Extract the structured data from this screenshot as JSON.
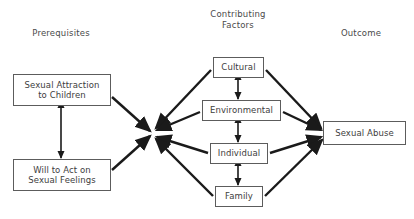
{
  "diagram": {
    "type": "flow-diagram",
    "background_color": "#ffffff",
    "line_color": "#1a1a1a",
    "box_border_color": "#5c5c5c",
    "text_color": "#3d3d3d",
    "columns": [
      {
        "id": "prerequisites",
        "label": "Prerequisites",
        "x": 61,
        "y": 33
      },
      {
        "id": "contributing-factors",
        "label": "Contributing\nFactors",
        "x": 238,
        "y": 14
      },
      {
        "id": "outcome",
        "label": "Outcome",
        "x": 361,
        "y": 33
      }
    ],
    "nodes": [
      {
        "id": "sexual-attraction",
        "label": "Sexual Attraction\nto Children",
        "x": 13,
        "y": 74,
        "w": 98,
        "h": 32
      },
      {
        "id": "will-to-act",
        "label": "Will to Act on\nSexual Feelings",
        "x": 13,
        "y": 159,
        "w": 98,
        "h": 32
      },
      {
        "id": "cultural",
        "label": "Cultural",
        "x": 213,
        "y": 57,
        "w": 51,
        "h": 21
      },
      {
        "id": "environmental",
        "label": "Environmental",
        "x": 202,
        "y": 100,
        "w": 79,
        "h": 21
      },
      {
        "id": "individual",
        "label": "Individual",
        "x": 210,
        "y": 143,
        "w": 58,
        "h": 21
      },
      {
        "id": "family",
        "label": "Family",
        "x": 215,
        "y": 186,
        "w": 48,
        "h": 21
      },
      {
        "id": "sexual-abuse",
        "label": "Sexual Abuse",
        "x": 323,
        "y": 121,
        "w": 83,
        "h": 24
      }
    ],
    "junction": {
      "id": "prerequisite-junction",
      "x": 152,
      "y": 133
    },
    "edges": [
      {
        "id": "attraction-to-junction",
        "from": "sexual-attraction",
        "to": "prerequisite-junction",
        "arrow": "single"
      },
      {
        "id": "will-to-junction",
        "from": "will-to-act",
        "to": "prerequisite-junction",
        "arrow": "single"
      },
      {
        "id": "attraction-will-bidirectional",
        "from": "sexual-attraction",
        "to": "will-to-act",
        "arrow": "double"
      },
      {
        "id": "cultural-to-junction",
        "from": "cultural",
        "to": "prerequisite-junction",
        "arrow": "single"
      },
      {
        "id": "environmental-to-junction",
        "from": "environmental",
        "to": "prerequisite-junction",
        "arrow": "single"
      },
      {
        "id": "individual-to-junction",
        "from": "individual",
        "to": "prerequisite-junction",
        "arrow": "single"
      },
      {
        "id": "family-to-junction",
        "from": "family",
        "to": "prerequisite-junction",
        "arrow": "single"
      },
      {
        "id": "cultural-environmental",
        "from": "cultural",
        "to": "environmental",
        "arrow": "double"
      },
      {
        "id": "environmental-individual",
        "from": "environmental",
        "to": "individual",
        "arrow": "double"
      },
      {
        "id": "individual-family",
        "from": "individual",
        "to": "family",
        "arrow": "double"
      },
      {
        "id": "cultural-to-abuse",
        "from": "cultural",
        "to": "sexual-abuse",
        "arrow": "single"
      },
      {
        "id": "environmental-to-abuse",
        "from": "environmental",
        "to": "sexual-abuse",
        "arrow": "single"
      },
      {
        "id": "individual-to-abuse",
        "from": "individual",
        "to": "sexual-abuse",
        "arrow": "single"
      },
      {
        "id": "family-to-abuse",
        "from": "family",
        "to": "sexual-abuse",
        "arrow": "single"
      }
    ]
  }
}
